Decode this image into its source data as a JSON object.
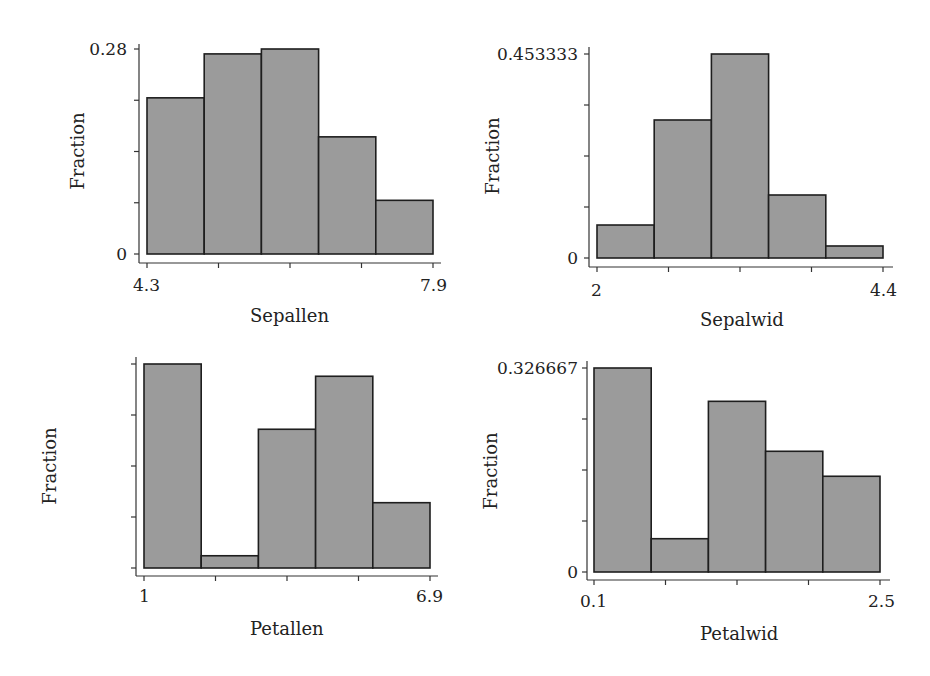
{
  "chart_data": [
    {
      "type": "bar",
      "panel": "top-left",
      "title": "",
      "xlabel": "Sepallen",
      "ylabel": "Fraction",
      "x_range": [
        4.3,
        7.9
      ],
      "x_tick_labels": [
        "4.3",
        "7.9"
      ],
      "y_tick_labels": [
        "0",
        "0.28"
      ],
      "ylim": [
        0,
        0.28
      ],
      "bins": 5,
      "bin_edges": [
        4.3,
        5.02,
        5.74,
        6.46,
        7.18,
        7.9
      ],
      "values": [
        0.2133,
        0.2733,
        0.28,
        0.16,
        0.0733
      ],
      "grid": false,
      "legend": null
    },
    {
      "type": "bar",
      "panel": "top-right",
      "title": "",
      "xlabel": "Sepalwid",
      "ylabel": "Fraction",
      "x_range": [
        2,
        4.4
      ],
      "x_tick_labels": [
        "2",
        "4.4"
      ],
      "y_tick_labels": [
        "0",
        "0.453333"
      ],
      "ylim": [
        0,
        0.453333
      ],
      "bins": 5,
      "bin_edges": [
        2.0,
        2.48,
        2.96,
        3.44,
        3.92,
        4.4
      ],
      "values": [
        0.0733,
        0.3067,
        0.453333,
        0.14,
        0.0267
      ],
      "grid": false,
      "legend": null
    },
    {
      "type": "bar",
      "panel": "bottom-left",
      "title": "",
      "xlabel": "Petallen",
      "ylabel": "Fraction",
      "x_range": [
        1,
        6.9
      ],
      "x_tick_labels": [
        "1",
        "6.9"
      ],
      "y_tick_labels": [
        "0",
        "0.333333"
      ],
      "ylim": [
        0,
        0.333333
      ],
      "bins": 5,
      "bin_edges": [
        1.0,
        2.18,
        3.36,
        4.54,
        5.72,
        6.9
      ],
      "values": [
        0.333333,
        0.02,
        0.2267,
        0.3133,
        0.1067
      ],
      "grid": false,
      "legend": null
    },
    {
      "type": "bar",
      "panel": "bottom-right",
      "title": "",
      "xlabel": "Petalwid",
      "ylabel": "Fraction",
      "x_range": [
        0.1,
        2.5
      ],
      "x_tick_labels": [
        "0.1",
        "2.5"
      ],
      "y_tick_labels": [
        "0",
        "0.326667"
      ],
      "ylim": [
        0,
        0.326667
      ],
      "bins": 5,
      "bin_edges": [
        0.1,
        0.58,
        1.06,
        1.54,
        2.02,
        2.5
      ],
      "values": [
        0.326667,
        0.0533,
        0.2733,
        0.1933,
        0.1533
      ],
      "grid": false,
      "legend": null
    }
  ],
  "style": {
    "bar_fill": "#9b9b9b",
    "bar_stroke": "#1e1e1e",
    "axis_color": "#333333"
  },
  "panels": [
    {
      "ylabel": "Fraction",
      "xlabel": "Sepallen",
      "ymax_label": "0.28",
      "ymin_label": "0",
      "xmin_label": "4.3",
      "xmax_label": "7.9"
    },
    {
      "ylabel": "Fraction",
      "xlabel": "Sepalwid",
      "ymax_label": "0.453333",
      "ymin_label": "0",
      "xmin_label": "2",
      "xmax_label": "4.4"
    },
    {
      "ylabel": "Fraction",
      "xlabel": "Petallen",
      "ymax_label": "0.333333",
      "ymin_label": "0",
      "xmin_label": "1",
      "xmax_label": "6.9"
    },
    {
      "ylabel": "Fraction",
      "xlabel": "Petalwid",
      "ymax_label": "0.326667",
      "ymin_label": "0",
      "xmin_label": "0.1",
      "xmax_label": "2.5"
    }
  ]
}
